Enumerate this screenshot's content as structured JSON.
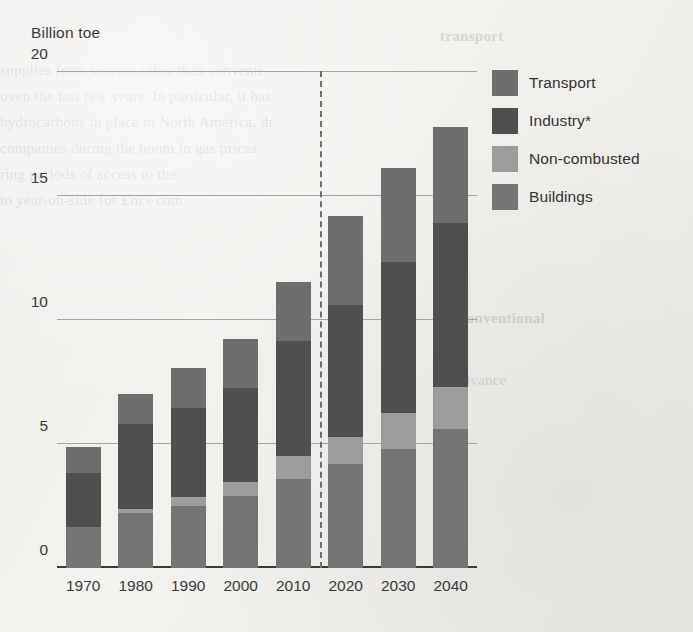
{
  "chart_data": {
    "type": "bar",
    "subtype": "stacked-bar",
    "title": "",
    "ylabel": "Billion toe",
    "xlabel": "",
    "ylim": [
      0,
      20
    ],
    "yticks": [
      0,
      5,
      10,
      15,
      20
    ],
    "grid": true,
    "legend_position": "right",
    "categories": [
      "1970",
      "1980",
      "1990",
      "2000",
      "2010",
      "2020",
      "2030",
      "2040"
    ],
    "stack_order_bottom_to_top": [
      "Buildings",
      "Non-combusted",
      "Industry*",
      "Transport"
    ],
    "series": [
      {
        "name": "Buildings",
        "color": "#757575",
        "values": [
          1.65,
          2.2,
          2.5,
          2.9,
          3.6,
          4.2,
          4.8,
          5.6
        ]
      },
      {
        "name": "Non-combusted",
        "color": "#9c9c9c",
        "values": [
          0,
          0.2,
          0.35,
          0.55,
          0.9,
          1.1,
          1.45,
          1.7
        ]
      },
      {
        "name": "Industry*",
        "color": "#4f4f4f",
        "values": [
          2.2,
          3.4,
          3.6,
          3.8,
          4.65,
          5.3,
          6.1,
          6.6
        ]
      },
      {
        "name": "Transport",
        "color": "#6e6e6e",
        "values": [
          1.05,
          1.2,
          1.6,
          2.0,
          2.4,
          3.6,
          3.8,
          3.9
        ]
      }
    ],
    "totals": [
      4.9,
      7.0,
      8.05,
      9.25,
      11.55,
      14.2,
      16.15,
      17.8
    ],
    "annotations": [
      {
        "type": "vertical-dashed-line",
        "name": "history-forecast-divider",
        "between": [
          "2010",
          "2020"
        ]
      }
    ]
  },
  "legend": {
    "items": [
      {
        "label": "Transport",
        "color": "#6e6e6e"
      },
      {
        "label": "Industry*",
        "color": "#4f4f4f"
      },
      {
        "label": "Non-combusted",
        "color": "#9c9c9c"
      },
      {
        "label": "Buildings",
        "color": "#757575"
      }
    ]
  },
  "background_text": {
    "lines": [
      "al advance",
      "supplies from sources other than conventi",
      "oven  the last few years. In particular, it has",
      "hydrocarbons in place in North America, dr",
      "companies during the boom in gas prices",
      "ring periods of access to the",
      "to year-on-side for Eni's com"
    ],
    "heading_right": "transport",
    "heading_mid": "Unconventional"
  }
}
